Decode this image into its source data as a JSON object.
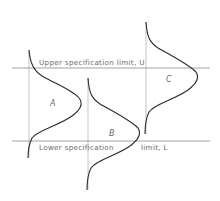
{
  "diagram": {
    "type": "process-capability",
    "upper_limit": {
      "label": "Upper specification limit, U",
      "y": 68
    },
    "lower_limit": {
      "label": "Lower specification",
      "label2": "limit, L",
      "y": 141
    },
    "distributions": [
      {
        "name": "A",
        "axis_x": 29,
        "top": 50,
        "bottom": 158,
        "peak_x": 81
      },
      {
        "name": "B",
        "axis_x": 88,
        "top": 78,
        "bottom": 190,
        "peak_x": 140
      },
      {
        "name": "C",
        "axis_x": 146,
        "top": 22,
        "bottom": 134,
        "peak_x": 198
      }
    ]
  },
  "colors": {
    "line": "#4a4a4a",
    "curve": "#2a2a2a",
    "text": "#6a6a6a"
  }
}
